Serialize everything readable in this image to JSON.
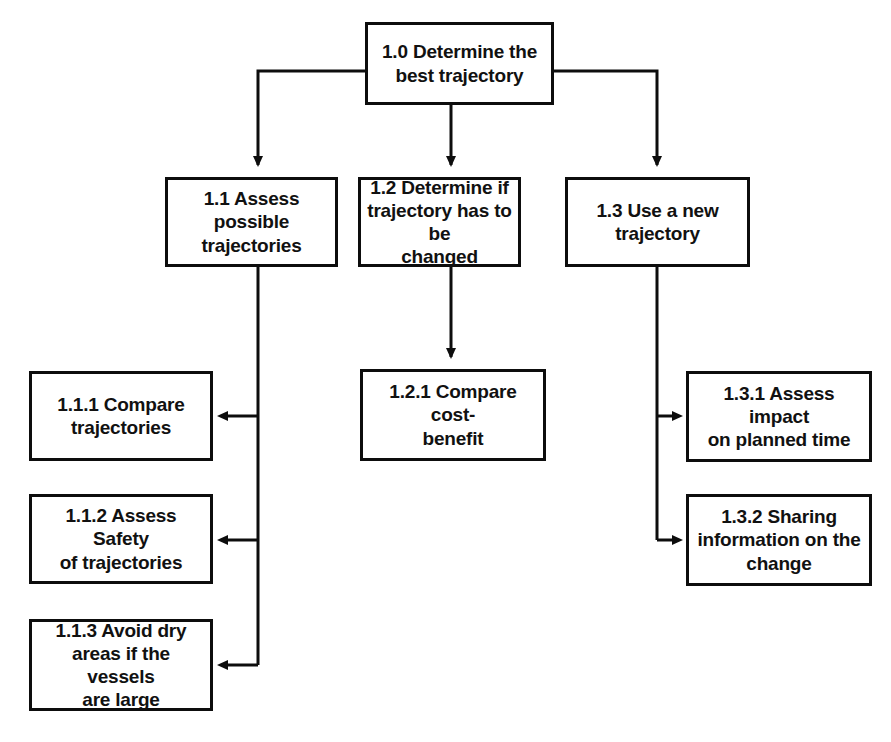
{
  "diagram": {
    "type": "hierarchy-tree",
    "line_color": "#0d0d0d",
    "background_color": "#ffffff",
    "text_color": "#111111",
    "nodes": {
      "root": {
        "id": "1.0",
        "label": "1.0 Determine the\nbest trajectory"
      },
      "level1": [
        {
          "id": "1.1",
          "label": "1.1 Assess possible\ntrajectories"
        },
        {
          "id": "1.2",
          "label": "1.2 Determine if\ntrajectory has to be\nchanged"
        },
        {
          "id": "1.3",
          "label": "1.3 Use a new\ntrajectory"
        }
      ],
      "level2_left": [
        {
          "id": "1.1.1",
          "label": "1.1.1 Compare\ntrajectories"
        },
        {
          "id": "1.1.2",
          "label": "1.1.2 Assess Safety\nof trajectories"
        },
        {
          "id": "1.1.3",
          "label": "1.1.3 Avoid dry\nareas if the vessels\nare large"
        }
      ],
      "level2_center": [
        {
          "id": "1.2.1",
          "label": "1.2.1 Compare cost-\nbenefit"
        }
      ],
      "level2_right": [
        {
          "id": "1.3.1",
          "label": "1.3.1 Assess impact\non planned time"
        },
        {
          "id": "1.3.2",
          "label": "1.3.2 Sharing\ninformation on the\nchange"
        }
      ]
    },
    "connectors": [
      {
        "name": "root-to-1-1",
        "from": "1.0",
        "to": "1.1",
        "arrow": "down"
      },
      {
        "name": "root-to-1-2",
        "from": "1.0",
        "to": "1.2",
        "arrow": "down"
      },
      {
        "name": "root-to-1-3",
        "from": "1.0",
        "to": "1.3",
        "arrow": "down"
      },
      {
        "name": "1-1-to-1-1-1",
        "from": "1.1",
        "to": "1.1.1",
        "arrow": "left"
      },
      {
        "name": "1-1-to-1-1-2",
        "from": "1.1",
        "to": "1.1.2",
        "arrow": "left"
      },
      {
        "name": "1-1-to-1-1-3",
        "from": "1.1",
        "to": "1.1.3",
        "arrow": "left"
      },
      {
        "name": "1-2-to-1-2-1",
        "from": "1.2",
        "to": "1.2.1",
        "arrow": "down"
      },
      {
        "name": "1-3-to-1-3-1",
        "from": "1.3",
        "to": "1.3.1",
        "arrow": "right"
      },
      {
        "name": "1-3-to-1-3-2",
        "from": "1.3",
        "to": "1.3.2",
        "arrow": "right"
      }
    ]
  }
}
